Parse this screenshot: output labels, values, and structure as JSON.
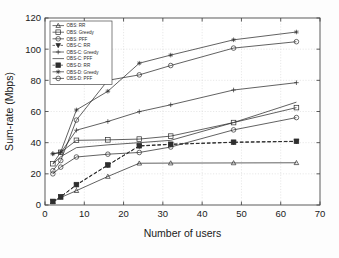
{
  "chart_data": {
    "type": "line",
    "title": "",
    "xlabel": "Number of users",
    "ylabel": "Sum-rate (Mbps)",
    "xlim": [
      0,
      70
    ],
    "ylim": [
      0,
      120
    ],
    "xticks": [
      0,
      10,
      20,
      30,
      40,
      50,
      60,
      70
    ],
    "yticks": [
      0,
      20,
      40,
      60,
      80,
      100,
      120
    ],
    "grid": true,
    "legend_position": "upper left",
    "x": [
      2,
      4,
      8,
      16,
      24,
      32,
      48,
      64
    ],
    "series": [
      {
        "name": "OBS: RR",
        "label": "OBS: RR",
        "marker": "triangle",
        "linestyle": "solid",
        "values": [
          2.0,
          4.8,
          9.2,
          18.3,
          26.8,
          26.9,
          27.0,
          27.1
        ]
      },
      {
        "name": "OBS: Greedy",
        "label": "OBS: Greedy",
        "marker": "square",
        "linestyle": "solid",
        "values": [
          26.5,
          33.8,
          41.5,
          41.8,
          42.3,
          44.2,
          52.9,
          62.5
        ]
      },
      {
        "name": "OBS: PFF",
        "label": "OBS: PFF",
        "marker": "circle",
        "linestyle": "solid",
        "values": [
          20.0,
          24.3,
          30.8,
          32.6,
          33.7,
          37.2,
          48.2,
          56.1
        ]
      },
      {
        "name": "OBS-C: RR",
        "label": "OBS-C: RR",
        "marker": "triangle-down",
        "linestyle": "dashed",
        "values": [
          2.2,
          5.2,
          12.8,
          25.5,
          37.8,
          38.9,
          40.2,
          40.8
        ]
      },
      {
        "name": "OBS-C: Greedy",
        "label": "OBS-C: Greedy",
        "marker": "plus",
        "linestyle": "solid",
        "values": [
          32.8,
          33.5,
          48.0,
          53.6,
          59.9,
          64.3,
          73.8,
          78.5
        ]
      },
      {
        "name": "OBS-C: PFF",
        "label": "OBS-C: PFF",
        "marker": "none",
        "linestyle": "solid",
        "values": [
          26.3,
          31.0,
          36.8,
          38.6,
          40.0,
          41.5,
          52.9,
          66.0
        ]
      },
      {
        "name": "OBS-D: RR",
        "label": "OBS-D: RR",
        "marker": "square-filled",
        "linestyle": "dashed",
        "values": [
          2.3,
          5.3,
          13.1,
          25.7,
          38.0,
          39.0,
          40.3,
          40.9
        ]
      },
      {
        "name": "OBS-D: Greedy",
        "label": "OBS-D: Greedy",
        "marker": "star",
        "linestyle": "solid",
        "values": [
          32.9,
          34.0,
          61.0,
          73.0,
          91.0,
          96.2,
          106.0,
          111.0
        ]
      },
      {
        "name": "OBS-D: PFF",
        "label": "OBS-D: PFF",
        "marker": "circle",
        "linestyle": "solid",
        "values": [
          22.0,
          28.5,
          54.5,
          80.0,
          83.5,
          89.5,
          100.7,
          104.8
        ]
      }
    ]
  },
  "axes": {
    "xlabel": "Number of users",
    "ylabel": "Sum-rate (Mbps)",
    "xtick_labels": [
      "0",
      "10",
      "20",
      "30",
      "40",
      "50",
      "60",
      "70"
    ],
    "ytick_labels": [
      "0",
      "20",
      "40",
      "60",
      "80",
      "100",
      "120"
    ]
  },
  "legend": {
    "items": [
      {
        "label": "OBS: RR"
      },
      {
        "label": "OBS: Greedy"
      },
      {
        "label": "OBS: PFF"
      },
      {
        "label": "OBS-C: RR"
      },
      {
        "label": "OBS-C: Greedy"
      },
      {
        "label": "OBS-C: PFF"
      },
      {
        "label": "OBS-D: RR"
      },
      {
        "label": "OBS-D: Greedy"
      },
      {
        "label": "OBS-D: PFF"
      }
    ]
  },
  "style": {
    "line_color": "#2e2e2e",
    "grid_color": "#d8d8d8",
    "axis_color": "#4a4a4a",
    "background": "#fdfdfd"
  }
}
